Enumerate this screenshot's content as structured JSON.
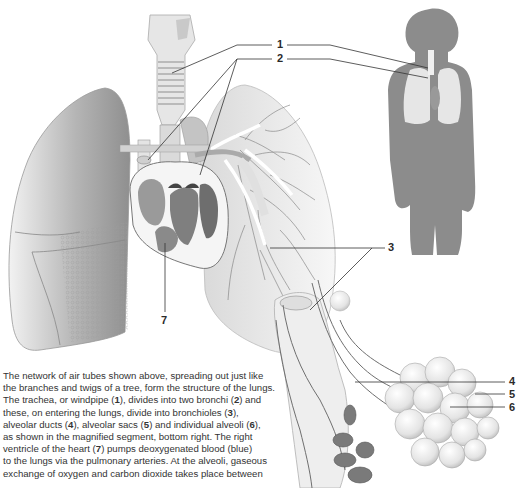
{
  "diagram": {
    "labels": [
      {
        "id": "1",
        "text": "1",
        "name": "trachea"
      },
      {
        "id": "2",
        "text": "2",
        "name": "bronchi"
      },
      {
        "id": "3",
        "text": "3",
        "name": "bronchioles"
      },
      {
        "id": "4",
        "text": "4",
        "name": "alveolar-ducts"
      },
      {
        "id": "5",
        "text": "5",
        "name": "alveolar-sacs"
      },
      {
        "id": "6",
        "text": "6",
        "name": "alveoli"
      },
      {
        "id": "7",
        "text": "7",
        "name": "right-ventricle"
      }
    ],
    "colors": {
      "background": "#ffffff",
      "silhouette": "#8c8c8c",
      "silhouette_lungs": "#e6e6e6",
      "leader_line": "#333333",
      "label_text": "#2a2a2a",
      "caption_text": "#333333"
    }
  },
  "caption": {
    "lines": [
      [
        "The network of air tubes shown above, spreading out just like"
      ],
      [
        "the branches and twigs of a tree, form the structure of the lungs."
      ],
      [
        "The trachea, or windpipe (",
        "1",
        "), divides into two bronchi (",
        "2",
        ") and"
      ],
      [
        "these, on entering the lungs, divide into bronchioles (",
        "3",
        "),"
      ],
      [
        "alveolar ducts (",
        "4",
        "), alveolar sacs (",
        "5",
        ") and individual alveoli (",
        "6",
        "),"
      ],
      [
        "as shown in the magnified segment, bottom right. The right"
      ],
      [
        "ventricle of the heart (",
        "7",
        ") pumps deoxygenated blood (blue)"
      ],
      [
        "to the lungs via the pulmonary arteries. At the alveoli, gaseous"
      ],
      [
        "exchange of oxygen and carbon dioxide takes place between"
      ]
    ]
  }
}
